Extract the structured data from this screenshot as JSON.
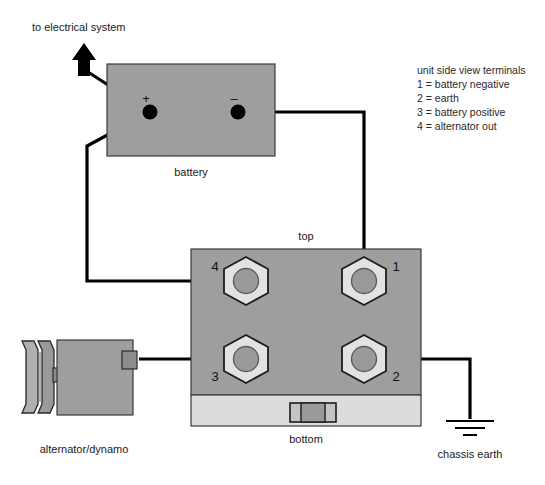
{
  "diagram": {
    "title_note": "to electrical system",
    "components": {
      "battery": {
        "label": "battery",
        "positive_sign": "+",
        "negative_sign": "–"
      },
      "regulator": {
        "top_label": "top",
        "bottom_label": "bottom",
        "terminals": [
          {
            "number": "4",
            "position": "top-left"
          },
          {
            "number": "1",
            "position": "top-right"
          },
          {
            "number": "3",
            "position": "bottom-left"
          },
          {
            "number": "2",
            "position": "bottom-right"
          }
        ]
      },
      "alternator": {
        "label": "alternator/dynamo"
      },
      "earth": {
        "label": "chassis earth"
      }
    },
    "legend": {
      "heading": "unit side view terminals",
      "entries": [
        "1 = battery negative",
        "2 = earth",
        "3 = battery positive",
        "4 = alternator out"
      ]
    },
    "colors": {
      "body_gray": "#9e9e9e",
      "panel_light": "#dcdcdc",
      "wire_black": "#000000",
      "hex_light": "#e2e2e2"
    }
  }
}
